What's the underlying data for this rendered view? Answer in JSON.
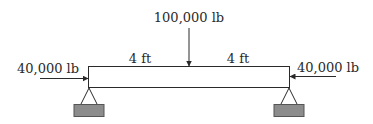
{
  "diagram": {
    "type": "simply-supported-beam",
    "top_load": {
      "label": "100,000 lb",
      "direction": "down"
    },
    "left_axial": {
      "label": "40,000 lb",
      "direction": "right"
    },
    "right_axial": {
      "label": "40,000 lb",
      "direction": "left"
    },
    "spans": [
      {
        "label": "4 ft"
      },
      {
        "label": "4 ft"
      }
    ],
    "colors": {
      "line": "#2a2a2a",
      "support_block": "#8c8c8c"
    }
  }
}
